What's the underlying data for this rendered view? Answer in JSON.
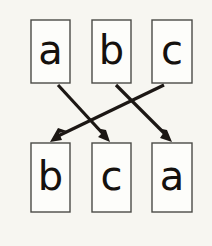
{
  "diagram": {
    "background_color": "#f7f6f1",
    "box_fill_color": "#fdfdfa",
    "box_stroke_color": "#4a4a46",
    "arrow_color": "#1c1714",
    "text_color": "#15110d",
    "top_row": {
      "name": "domain-row",
      "items": [
        {
          "label": "a",
          "x": 31,
          "y": 20,
          "w": 39,
          "h": 63
        },
        {
          "label": "b",
          "x": 92,
          "y": 20,
          "w": 39,
          "h": 63
        },
        {
          "label": "c",
          "x": 152,
          "y": 20,
          "w": 40,
          "h": 63
        }
      ]
    },
    "bottom_row": {
      "name": "codomain-row",
      "items": [
        {
          "label": "b",
          "x": 31,
          "y": 143,
          "w": 39,
          "h": 69
        },
        {
          "label": "c",
          "x": 92,
          "y": 143,
          "w": 39,
          "h": 69
        },
        {
          "label": "a",
          "x": 152,
          "y": 143,
          "w": 40,
          "h": 69
        }
      ]
    },
    "arrows": [
      {
        "name": "arrow-a-to-c",
        "from_label": "a",
        "to_label": "c",
        "x1": 58,
        "y1": 85,
        "x2": 110,
        "y2": 142,
        "head_angle_deg": 48
      },
      {
        "name": "arrow-b-to-a",
        "from_label": "b",
        "to_label": "a",
        "x1": 116,
        "y1": 85,
        "x2": 172,
        "y2": 142,
        "head_angle_deg": 45
      },
      {
        "name": "arrow-c-to-b",
        "from_label": "c",
        "to_label": "b",
        "x1": 164,
        "y1": 85,
        "x2": 50,
        "y2": 142,
        "head_angle_deg": 153
      }
    ]
  }
}
